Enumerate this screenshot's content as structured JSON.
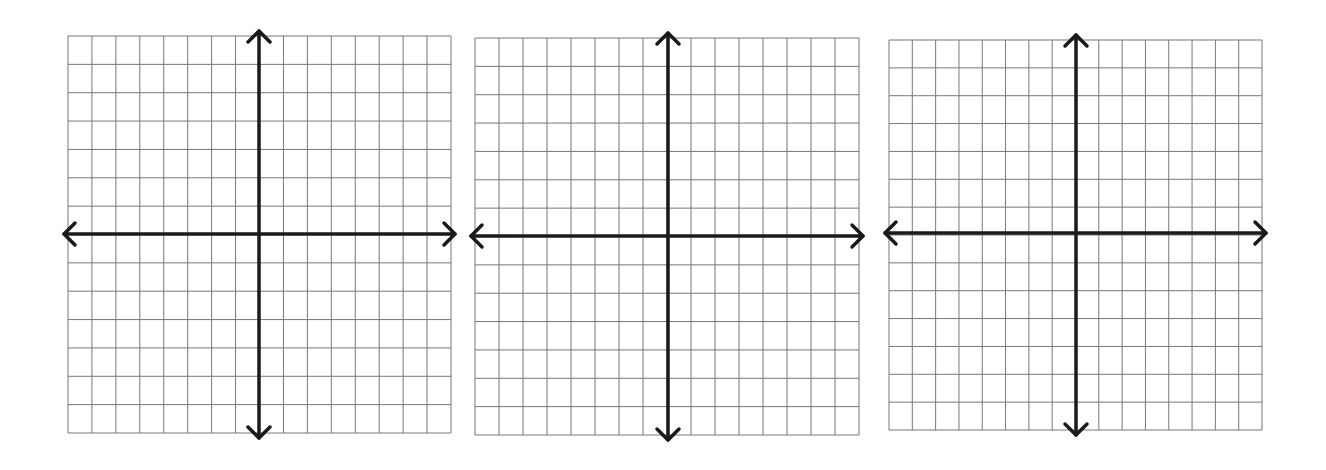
{
  "colors": {
    "grid": "#777777",
    "axis": "#1a1a1a",
    "background": "#ffffff"
  },
  "grid_spec": {
    "columns": 16,
    "rows": 14,
    "y_axis_line_index": 8,
    "x_axis_line_index": 7
  },
  "planes": [
    {
      "name": "coordinate-plane-1",
      "left": 68,
      "top": 36,
      "width": 383,
      "height": 397,
      "axis_x": 259,
      "axis_y": 234
    },
    {
      "name": "coordinate-plane-2",
      "left": 475,
      "top": 38,
      "width": 384,
      "height": 397,
      "axis_x": 668,
      "axis_y": 236
    },
    {
      "name": "coordinate-plane-3",
      "left": 889,
      "top": 40,
      "width": 373,
      "height": 390,
      "axis_x": 1076,
      "axis_y": 233
    }
  ]
}
